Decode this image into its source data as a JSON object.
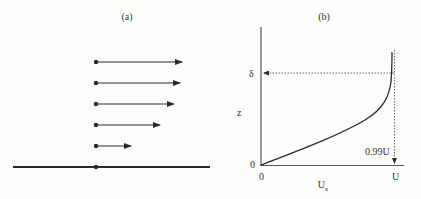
{
  "panel_a": {
    "label": "(a)",
    "arrows": [
      {
        "y": 62,
        "tip_x": 182
      },
      {
        "y": 83,
        "tip_x": 180
      },
      {
        "y": 104,
        "tip_x": 174
      },
      {
        "y": 125,
        "tip_x": 160
      },
      {
        "y": 146,
        "tip_x": 131
      }
    ]
  },
  "panel_b": {
    "label": "(b)",
    "y_axis_label": "z",
    "x_axis_label": "U",
    "x_axis_label_sub": "x",
    "delta_label": "δ",
    "y_origin_label": "0",
    "x_origin_label": "0",
    "x_end_label": "U",
    "annotation_label": "0.99U"
  },
  "colors": {
    "ink": "#2a2a2a",
    "background": "#fdfdfb"
  }
}
